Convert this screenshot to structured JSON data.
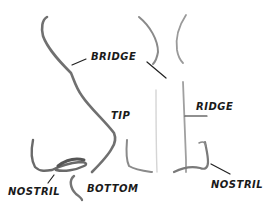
{
  "diagram": {
    "views": [
      "side-profile",
      "front"
    ],
    "labels": {
      "bridge": "BRIDGE",
      "ridge": "RIDGE",
      "tip": "TIP",
      "nostril_left": "NOSTRIL",
      "bottom": "BOTTOM",
      "nostril_right": "NOSTRIL"
    },
    "colors": {
      "background": "#ffffff",
      "stroke_dark": "#6e6e6e",
      "stroke_light": "#bdbdbd",
      "text": "#1a1a1a",
      "leader_line": "#222222"
    }
  }
}
